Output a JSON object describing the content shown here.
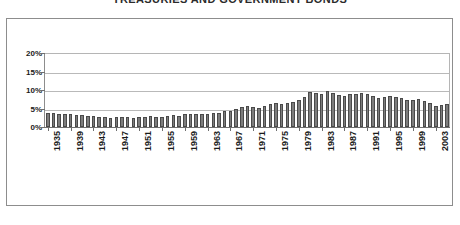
{
  "chart_data": {
    "type": "bar",
    "title": "TREASURIES AND GOVERNMENT BONDS",
    "xlabel": "",
    "ylabel": "",
    "ylim": [
      0,
      20
    ],
    "ytick_labels": [
      "20%",
      "15%",
      "10%",
      "5%",
      "0%"
    ],
    "ytick_values": [
      20,
      15,
      10,
      5,
      0
    ],
    "grid": true,
    "legend": "none",
    "xtick_labels": [
      "1935",
      "1939",
      "1943",
      "1947",
      "1951",
      "1955",
      "1959",
      "1963",
      "1967",
      "1971",
      "1975",
      "1979",
      "1983",
      "1987",
      "1991",
      "1995",
      "1999",
      "2003"
    ],
    "xtick_step": 4,
    "categories": [
      "1935",
      "1936",
      "1937",
      "1938",
      "1939",
      "1940",
      "1941",
      "1942",
      "1943",
      "1944",
      "1945",
      "1946",
      "1947",
      "1948",
      "1949",
      "1950",
      "1951",
      "1952",
      "1953",
      "1954",
      "1955",
      "1956",
      "1957",
      "1958",
      "1959",
      "1960",
      "1961",
      "1962",
      "1963",
      "1964",
      "1965",
      "1966",
      "1967",
      "1968",
      "1969",
      "1970",
      "1971",
      "1972",
      "1973",
      "1974",
      "1975",
      "1976",
      "1977",
      "1978",
      "1979",
      "1980",
      "1981",
      "1982",
      "1983",
      "1984",
      "1985",
      "1986",
      "1987",
      "1988",
      "1989",
      "1990",
      "1991",
      "1992",
      "1993",
      "1994",
      "1995",
      "1996",
      "1997",
      "1998",
      "1999",
      "2000",
      "2001",
      "2002",
      "2003",
      "2004",
      "2005"
    ],
    "values": [
      3.8,
      3.7,
      3.6,
      3.5,
      3.4,
      3.3,
      3.2,
      3.0,
      2.9,
      2.8,
      2.6,
      2.5,
      2.6,
      2.8,
      2.7,
      2.5,
      2.6,
      2.8,
      3.0,
      2.7,
      2.6,
      2.9,
      3.3,
      3.1,
      3.6,
      3.5,
      3.4,
      3.5,
      3.6,
      3.7,
      3.8,
      4.2,
      4.4,
      4.8,
      5.3,
      5.6,
      5.3,
      5.2,
      5.6,
      6.2,
      6.4,
      6.3,
      6.4,
      6.8,
      7.2,
      8.2,
      9.4,
      9.2,
      8.8,
      9.6,
      9.3,
      8.6,
      8.4,
      8.8,
      9.0,
      9.2,
      9.0,
      8.4,
      7.8,
      8.2,
      8.4,
      8.0,
      7.8,
      7.4,
      7.2,
      7.6,
      7.0,
      6.4,
      5.8,
      6.0,
      6.2
    ]
  }
}
